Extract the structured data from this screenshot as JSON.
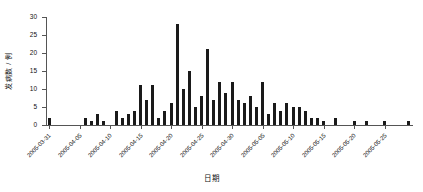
{
  "chart_data": {
    "type": "bar",
    "title": "",
    "xlabel": "日期",
    "ylabel": "发病数 / 例",
    "ylim": [
      0,
      30
    ],
    "yticks": [
      0,
      5,
      10,
      15,
      20,
      25,
      30
    ],
    "grid": false,
    "legend": null,
    "bar_color": "#1a1a1a",
    "axis_color": "#555555",
    "xtick_labels": [
      "2005-03-31",
      "2005-04-05",
      "2005-04-10",
      "2005-04-15",
      "2005-04-20",
      "2005-04-25",
      "2005-04-30",
      "2005-05-05",
      "2005-05-10",
      "2005-05-15",
      "2005-05-20",
      "2005-05-25"
    ],
    "xtick_dates": [
      "2005-03-31",
      "2005-04-05",
      "2005-04-10",
      "2005-04-15",
      "2005-04-20",
      "2005-04-25",
      "2005-04-30",
      "2005-05-05",
      "2005-05-10",
      "2005-05-15",
      "2005-05-20",
      "2005-05-25"
    ],
    "x_start": "2005-03-31",
    "x_end": "2005-05-29",
    "categories": [
      "2005-03-31",
      "2005-04-01",
      "2005-04-02",
      "2005-04-03",
      "2005-04-04",
      "2005-04-05",
      "2005-04-06",
      "2005-04-07",
      "2005-04-08",
      "2005-04-09",
      "2005-04-10",
      "2005-04-11",
      "2005-04-12",
      "2005-04-13",
      "2005-04-14",
      "2005-04-15",
      "2005-04-16",
      "2005-04-17",
      "2005-04-18",
      "2005-04-19",
      "2005-04-20",
      "2005-04-21",
      "2005-04-22",
      "2005-04-23",
      "2005-04-24",
      "2005-04-25",
      "2005-04-26",
      "2005-04-27",
      "2005-04-28",
      "2005-04-29",
      "2005-04-30",
      "2005-05-01",
      "2005-05-02",
      "2005-05-03",
      "2005-05-04",
      "2005-05-05",
      "2005-05-06",
      "2005-05-07",
      "2005-05-08",
      "2005-05-09",
      "2005-05-10",
      "2005-05-11",
      "2005-05-12",
      "2005-05-13",
      "2005-05-14",
      "2005-05-15",
      "2005-05-16",
      "2005-05-17",
      "2005-05-18",
      "2005-05-19",
      "2005-05-20",
      "2005-05-21",
      "2005-05-22",
      "2005-05-23",
      "2005-05-24",
      "2005-05-25",
      "2005-05-26",
      "2005-05-27",
      "2005-05-28",
      "2005-05-29"
    ],
    "values": [
      2,
      0,
      0,
      0,
      0,
      0,
      2,
      1,
      3,
      1,
      0,
      4,
      2,
      3,
      4,
      11,
      7,
      11,
      2,
      4,
      6,
      28,
      10,
      15,
      5,
      8,
      21,
      7,
      12,
      9,
      12,
      7,
      6,
      8,
      5,
      12,
      3,
      6,
      4,
      6,
      5,
      5,
      4,
      2,
      2,
      1,
      0,
      2,
      0,
      0,
      1,
      0,
      1,
      0,
      0,
      1,
      0,
      0,
      0,
      1
    ]
  },
  "axes": {
    "y_axis_name": "发病数 / 例",
    "x_axis_name": "日期"
  }
}
